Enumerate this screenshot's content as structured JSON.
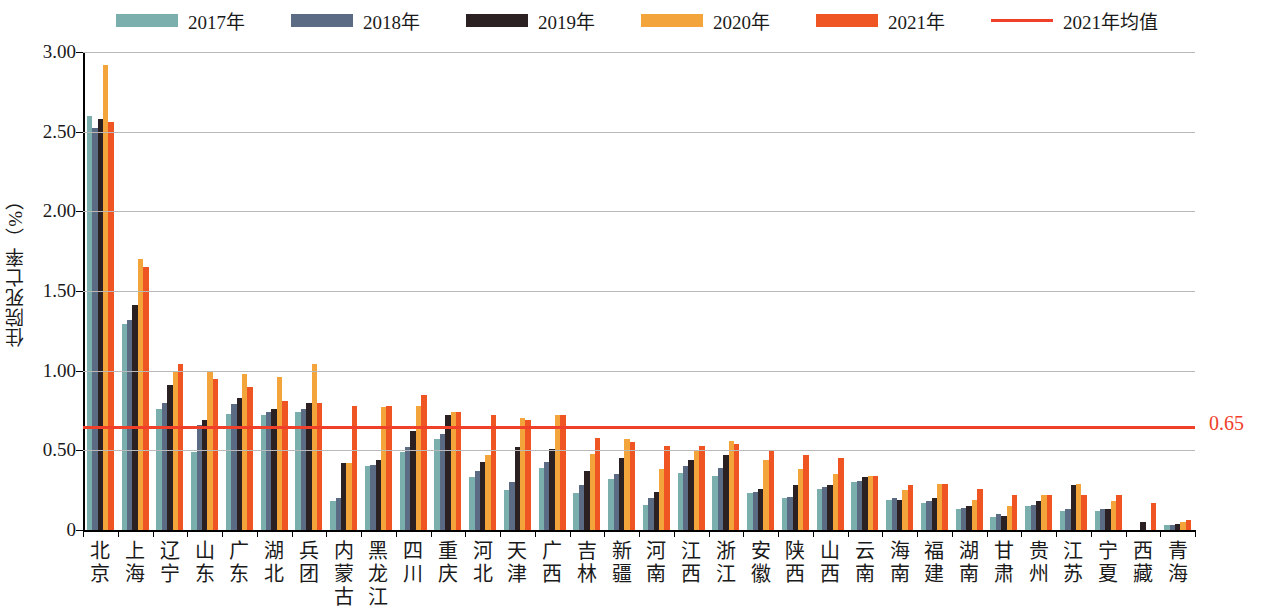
{
  "chart_data": {
    "type": "bar",
    "title": "",
    "subtitle": "",
    "xlabel": "",
    "ylabel": "住院死亡率（%）",
    "ylim": [
      0,
      3.0
    ],
    "ytick_labels": [
      "0",
      "0.50",
      "1.00",
      "1.50",
      "2.00",
      "2.50",
      "3.00"
    ],
    "ytick_values": [
      0,
      0.5,
      1.0,
      1.5,
      2.0,
      2.5,
      3.0
    ],
    "grid": true,
    "legend_position": "top-center",
    "categories": [
      "北京",
      "上海",
      "辽宁",
      "山东",
      "广东",
      "湖北",
      "兵团",
      "内蒙古",
      "黑龙江",
      "四川",
      "重庆",
      "河北",
      "天津",
      "广西",
      "吉林",
      "新疆",
      "河南",
      "江西",
      "浙江",
      "安徽",
      "陕西",
      "山西",
      "云南",
      "海南",
      "福建",
      "湖南",
      "甘肃",
      "贵州",
      "江苏",
      "宁夏",
      "西藏",
      "青海"
    ],
    "series": [
      {
        "name": "2017年",
        "color": "#7aafae",
        "values": [
          2.6,
          1.29,
          0.76,
          0.49,
          0.73,
          0.72,
          0.74,
          0.18,
          0.4,
          0.49,
          0.57,
          0.33,
          0.25,
          0.39,
          0.23,
          0.32,
          0.16,
          0.36,
          0.34,
          0.23,
          0.2,
          0.26,
          0.3,
          0.19,
          0.17,
          0.13,
          0.08,
          0.15,
          0.12,
          0.12,
          0.0,
          0.03
        ]
      },
      {
        "name": "2018年",
        "color": "#5b6b84",
        "values": [
          2.52,
          1.32,
          0.8,
          0.66,
          0.79,
          0.74,
          0.76,
          0.2,
          0.41,
          0.52,
          0.6,
          0.37,
          0.3,
          0.43,
          0.28,
          0.35,
          0.2,
          0.4,
          0.39,
          0.24,
          0.21,
          0.27,
          0.31,
          0.2,
          0.18,
          0.14,
          0.1,
          0.16,
          0.13,
          0.13,
          0.0,
          0.03
        ]
      },
      {
        "name": "2019年",
        "color": "#2b2022",
        "values": [
          2.58,
          1.41,
          0.91,
          0.69,
          0.83,
          0.76,
          0.8,
          0.42,
          0.44,
          0.62,
          0.72,
          0.43,
          0.52,
          0.51,
          0.37,
          0.45,
          0.24,
          0.44,
          0.47,
          0.26,
          0.28,
          0.28,
          0.33,
          0.19,
          0.2,
          0.15,
          0.09,
          0.18,
          0.28,
          0.13,
          0.05,
          0.04
        ]
      },
      {
        "name": "2020年",
        "color": "#f3a43b",
        "values": [
          2.92,
          1.7,
          1.0,
          1.0,
          0.98,
          0.96,
          1.04,
          0.42,
          0.77,
          0.78,
          0.74,
          0.47,
          0.7,
          0.72,
          0.48,
          0.57,
          0.38,
          0.5,
          0.56,
          0.44,
          0.38,
          0.35,
          0.34,
          0.25,
          0.29,
          0.19,
          0.15,
          0.22,
          0.29,
          0.18,
          0.0,
          0.05
        ]
      },
      {
        "name": "2021年",
        "color": "#ef5523",
        "values": [
          2.56,
          1.65,
          1.04,
          0.95,
          0.9,
          0.81,
          0.8,
          0.78,
          0.78,
          0.85,
          0.74,
          0.72,
          0.69,
          0.72,
          0.58,
          0.55,
          0.53,
          0.53,
          0.54,
          0.5,
          0.47,
          0.45,
          0.34,
          0.28,
          0.29,
          0.26,
          0.22,
          0.22,
          0.22,
          0.22,
          0.17,
          0.06
        ]
      }
    ],
    "average_line": {
      "name": "2021年均值",
      "value": 0.65,
      "label": "0.65",
      "color": "#f0402a"
    }
  },
  "legend": {
    "items": [
      {
        "label": "2017年",
        "type": "swatch",
        "color": "#7aafae"
      },
      {
        "label": "2018年",
        "type": "swatch",
        "color": "#5b6b84"
      },
      {
        "label": "2019年",
        "type": "swatch",
        "color": "#2b2022"
      },
      {
        "label": "2020年",
        "type": "swatch",
        "color": "#f3a43b"
      },
      {
        "label": "2021年",
        "type": "swatch",
        "color": "#ef5523"
      },
      {
        "label": "2021年均值",
        "type": "line",
        "color": "#f0402a"
      }
    ]
  }
}
